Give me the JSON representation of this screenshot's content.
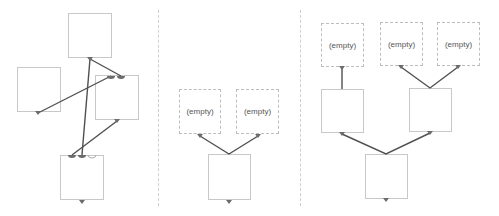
{
  "colors": {
    "link": "#505050",
    "port": "#6b6b6b",
    "border": "#c8c8c8",
    "empty_border": "#bdbdbd",
    "divider": "#cfcfcf"
  },
  "panels": [
    {
      "name": "panel-1",
      "nodes": [
        {
          "id": "n1",
          "label": "",
          "empty": false
        },
        {
          "id": "n2",
          "label": "",
          "empty": false
        },
        {
          "id": "n3",
          "label": "",
          "empty": false
        },
        {
          "id": "n4",
          "label": "",
          "empty": false
        }
      ]
    },
    {
      "name": "panel-2",
      "nodes": [
        {
          "id": "m1",
          "label": "(empty)",
          "empty": true
        },
        {
          "id": "m2",
          "label": "(empty)",
          "empty": true
        },
        {
          "id": "m3",
          "label": "",
          "empty": false
        }
      ]
    },
    {
      "name": "panel-3",
      "nodes": [
        {
          "id": "r1",
          "label": "(empty)",
          "empty": true
        },
        {
          "id": "r2",
          "label": "(empty)",
          "empty": true
        },
        {
          "id": "r3",
          "label": "(empty)",
          "empty": true
        },
        {
          "id": "r4",
          "label": "",
          "empty": false
        },
        {
          "id": "r5",
          "label": "",
          "empty": false
        },
        {
          "id": "r6",
          "label": "",
          "empty": false
        }
      ]
    }
  ]
}
